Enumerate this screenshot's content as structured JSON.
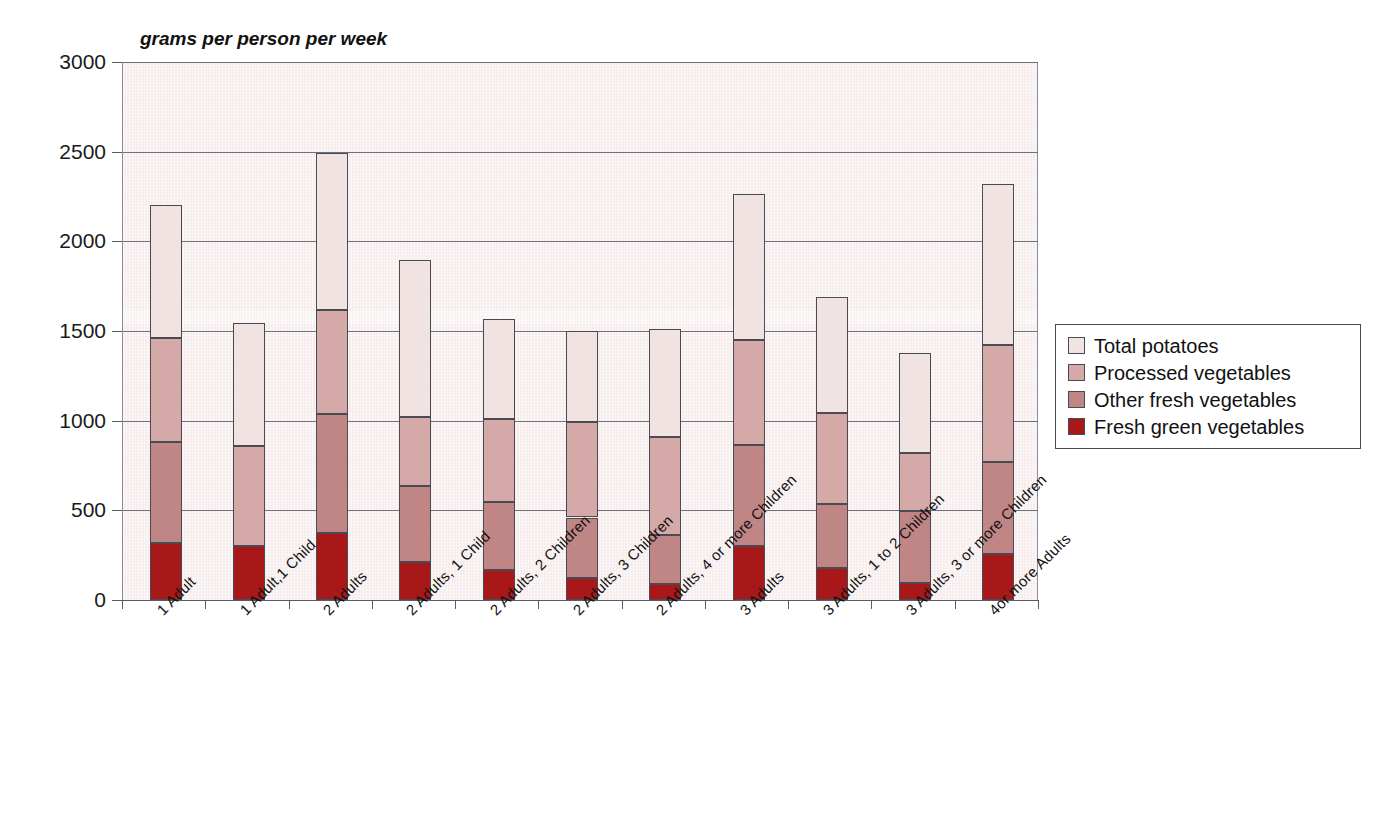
{
  "chart_data": {
    "type": "bar",
    "subtype": "stacked-bar-vertical",
    "title": "",
    "xlabel": "",
    "ylabel": "grams per person per week",
    "ylim": [
      0,
      3000
    ],
    "ytick_values": [
      0,
      500,
      1000,
      1500,
      2000,
      2500,
      3000
    ],
    "ytick_labels": [
      "0",
      "500",
      "1000",
      "1500",
      "2000",
      "2500",
      "3000"
    ],
    "grid": "horizontal",
    "legend_position": "right",
    "categories": [
      "1 Adult",
      "1 Adult,1 Child",
      "2 Adults",
      "2 Adults, 1 Child",
      "2 Adults, 2 Children",
      "2 Adults, 3 Children",
      "2 Adults, 4 or more Children",
      "3 Adults",
      "3 Adults, 1 to 2 Children",
      "3 Adults, 3 or more Children",
      "4or more Adults"
    ],
    "series": [
      {
        "name": "Fresh green vegetables",
        "color": "#A81818",
        "values": [
          320,
          300,
          375,
          210,
          165,
          125,
          90,
          300,
          180,
          95,
          255
        ]
      },
      {
        "name": "Other fresh vegetables",
        "color": "#C08585",
        "values": [
          560,
          0,
          660,
          425,
          380,
          335,
          275,
          565,
          355,
          400,
          515
        ]
      },
      {
        "name": "Processed vegetables",
        "color": "#D6A9A9",
        "values": [
          580,
          560,
          580,
          385,
          465,
          530,
          545,
          585,
          510,
          325,
          650
        ]
      },
      {
        "name": "Total potatoes",
        "color": "#F2E3E3",
        "values": [
          745,
          685,
          880,
          875,
          555,
          510,
          600,
          815,
          645,
          555,
          900
        ]
      }
    ],
    "stack_totals": [
      2205,
      1545,
      2495,
      1895,
      1565,
      1500,
      1510,
      2265,
      1690,
      1375,
      2320
    ]
  },
  "legend": {
    "items": [
      {
        "label": "Total potatoes",
        "color": "#F2E3E3"
      },
      {
        "label": "Processed vegetables",
        "color": "#D6A9A9"
      },
      {
        "label": "Other fresh vegetables",
        "color": "#C08585"
      },
      {
        "label": "Fresh green vegetables",
        "color": "#A81818"
      }
    ]
  },
  "axes": {
    "y_title": "grams per person per week",
    "y_ticks": [
      "3000",
      "2500",
      "2000",
      "1500",
      "1000",
      "500",
      "0"
    ]
  },
  "colors": {
    "plot_background": "#f6ecec",
    "axis_line": "#5a5a68",
    "gridline": "#6f6f7e",
    "bar_outline": "#4a4a52",
    "text": "#111111"
  }
}
